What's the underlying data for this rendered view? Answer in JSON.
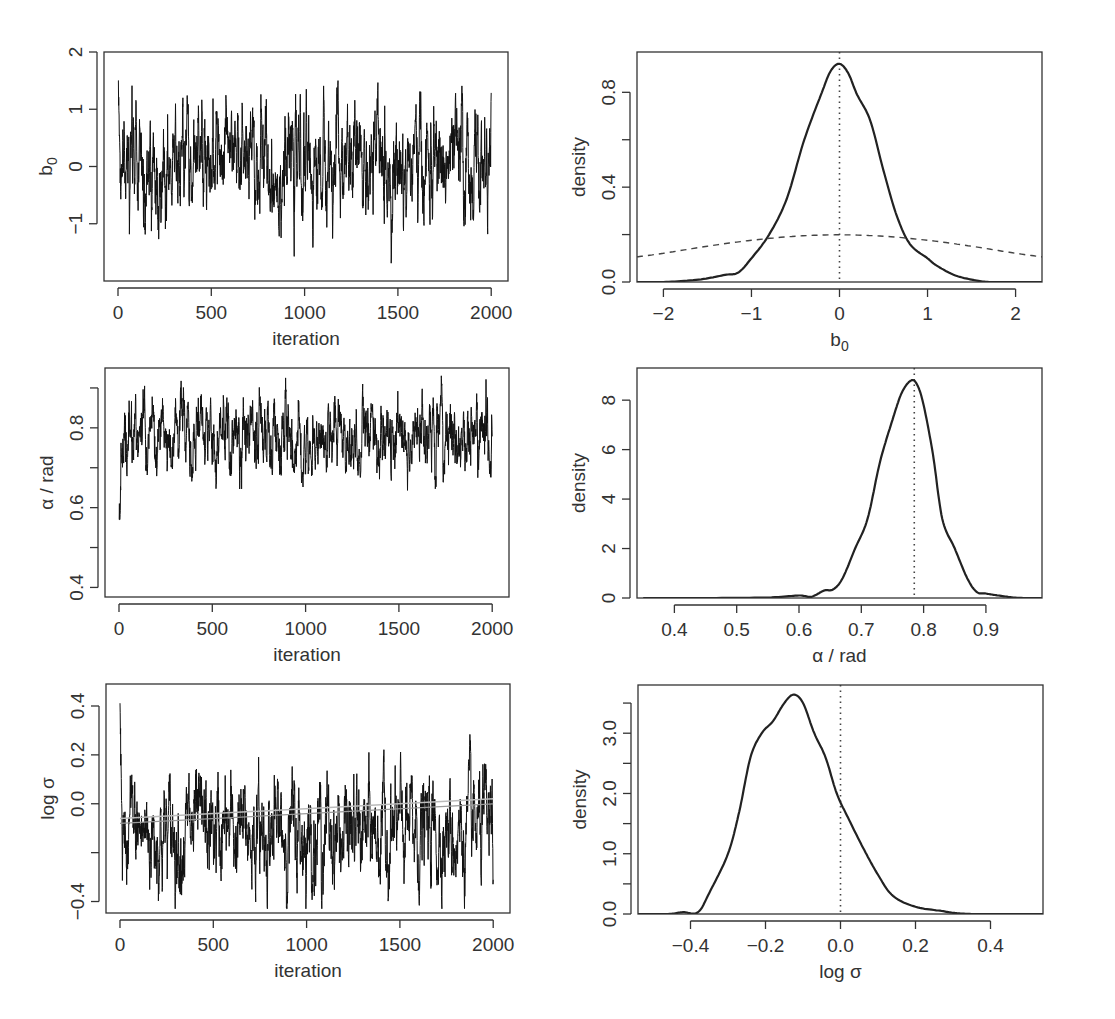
{
  "chart_data": [
    {
      "id": "trace_b0",
      "type": "line",
      "title": "",
      "xlabel": "iteration",
      "ylabel": "b0",
      "ylabel_display": "b",
      "ylabel_sub": "0",
      "xlim": [
        0,
        2000
      ],
      "ylim": [
        -2,
        2
      ],
      "xticks": [
        "0",
        "500",
        "1000",
        "1500",
        "2000"
      ],
      "yticks": [
        "−1",
        "0",
        "1",
        "2"
      ],
      "grid": false,
      "series": [
        {
          "name": "b0 MCMC trace",
          "x_range": [
            0,
            2000
          ],
          "start": 1.85,
          "mean": 0.0,
          "sd": 0.45,
          "min": -1.85,
          "max": 1.5
        }
      ]
    },
    {
      "id": "density_b0",
      "type": "line",
      "title": "",
      "xlabel": "b0",
      "xlabel_display": "b",
      "xlabel_sub": "0",
      "ylabel": "density",
      "xlim": [
        -2.3,
        2.3
      ],
      "ylim": [
        0,
        0.97
      ],
      "xticks": [
        "−2",
        "−1",
        "0",
        "1",
        "2"
      ],
      "yticks": [
        "0.0",
        "0.4",
        "0.8"
      ],
      "grid": false,
      "reference_line_x": 0,
      "series": [
        {
          "name": "posterior density",
          "style": "solid",
          "x": [
            -2.3,
            -2.0,
            -1.6,
            -1.3,
            -1.15,
            -1.0,
            -0.8,
            -0.6,
            -0.4,
            -0.2,
            -0.1,
            0.0,
            0.1,
            0.2,
            0.35,
            0.5,
            0.65,
            0.8,
            1.0,
            1.1,
            1.3,
            1.5,
            1.7,
            2.0,
            2.3
          ],
          "y": [
            0.0,
            0.0,
            0.01,
            0.03,
            0.04,
            0.1,
            0.2,
            0.35,
            0.6,
            0.8,
            0.89,
            0.92,
            0.88,
            0.79,
            0.68,
            0.47,
            0.28,
            0.16,
            0.1,
            0.07,
            0.03,
            0.01,
            0.0,
            0.0,
            0.0
          ]
        },
        {
          "name": "prior density",
          "style": "dashed",
          "x": [
            -2.3,
            -2.0,
            -1.5,
            -1.0,
            -0.5,
            0.0,
            0.5,
            1.0,
            1.5,
            2.0,
            2.3
          ],
          "y": [
            0.106,
            0.121,
            0.151,
            0.176,
            0.193,
            0.199,
            0.193,
            0.176,
            0.151,
            0.121,
            0.106
          ]
        }
      ]
    },
    {
      "id": "trace_alpha",
      "type": "line",
      "title": "",
      "xlabel": "iteration",
      "ylabel": "α / rad",
      "xlim": [
        0,
        2000
      ],
      "ylim": [
        0.38,
        0.95
      ],
      "xticks": [
        "0",
        "500",
        "1000",
        "1500",
        "2000"
      ],
      "yticks": [
        "0.4",
        "0.6",
        "0.8"
      ],
      "grid": false,
      "series": [
        {
          "name": "alpha MCMC trace",
          "x_range": [
            0,
            2000
          ],
          "start": 0.39,
          "mean": 0.775,
          "sd": 0.045,
          "min": 0.57,
          "max": 0.94
        }
      ]
    },
    {
      "id": "density_alpha",
      "type": "line",
      "title": "",
      "xlabel": "α / rad",
      "ylabel": "density",
      "xlim": [
        0.34,
        0.99
      ],
      "ylim": [
        0,
        9
      ],
      "xticks": [
        "0.4",
        "0.5",
        "0.6",
        "0.7",
        "0.8",
        "0.9"
      ],
      "yticks": [
        "0",
        "2",
        "4",
        "6",
        "8"
      ],
      "grid": false,
      "reference_line_x": 0.785,
      "series": [
        {
          "name": "posterior density",
          "style": "solid",
          "x": [
            0.35,
            0.45,
            0.55,
            0.6,
            0.62,
            0.64,
            0.655,
            0.67,
            0.69,
            0.71,
            0.73,
            0.75,
            0.765,
            0.78,
            0.79,
            0.8,
            0.815,
            0.83,
            0.85,
            0.87,
            0.885,
            0.9,
            0.92,
            0.95,
            0.99
          ],
          "y": [
            0.0,
            0.0,
            0.02,
            0.1,
            0.05,
            0.3,
            0.35,
            0.8,
            2.0,
            3.2,
            5.5,
            7.2,
            8.3,
            8.8,
            8.6,
            7.8,
            5.8,
            3.2,
            2.0,
            0.8,
            0.25,
            0.18,
            0.1,
            0.01,
            0.0
          ]
        }
      ]
    },
    {
      "id": "trace_logsigma",
      "type": "line",
      "title": "",
      "xlabel": "iteration",
      "ylabel": "log σ",
      "xlim": [
        0,
        2000
      ],
      "ylim": [
        -0.46,
        0.48
      ],
      "xticks": [
        "0",
        "500",
        "1000",
        "1500",
        "2000"
      ],
      "yticks": [
        "−0.4",
        "0.0",
        "0.2",
        "0.4"
      ],
      "grid": false,
      "series": [
        {
          "name": "log sigma MCMC trace",
          "x_range": [
            0,
            2000
          ],
          "start": 0.41,
          "mean": -0.12,
          "sd": 0.1,
          "min": -0.43,
          "max": 0.45
        },
        {
          "name": "running summary (grey)",
          "x": [
            0,
            2000
          ],
          "y": [
            -0.06,
            0.02
          ]
        }
      ]
    },
    {
      "id": "density_logsigma",
      "type": "line",
      "title": "",
      "xlabel": "log σ",
      "ylabel": "density",
      "xlim": [
        -0.54,
        0.54
      ],
      "ylim": [
        0,
        3.8
      ],
      "xticks": [
        "−0.4",
        "−0.2",
        "0.0",
        "0.2",
        "0.4"
      ],
      "yticks": [
        "0.0",
        "1.0",
        "2.0",
        "3.0"
      ],
      "grid": false,
      "reference_line_x": 0.0,
      "series": [
        {
          "name": "posterior density",
          "style": "solid",
          "x": [
            -0.54,
            -0.46,
            -0.42,
            -0.38,
            -0.35,
            -0.3,
            -0.27,
            -0.24,
            -0.21,
            -0.18,
            -0.15,
            -0.125,
            -0.1,
            -0.07,
            -0.04,
            -0.01,
            0.02,
            0.06,
            0.1,
            0.14,
            0.2,
            0.27,
            0.3,
            0.35,
            0.45,
            0.54
          ],
          "y": [
            0.0,
            0.0,
            0.03,
            0.03,
            0.35,
            1.0,
            1.7,
            2.6,
            3.0,
            3.2,
            3.5,
            3.64,
            3.5,
            3.0,
            2.6,
            2.0,
            1.6,
            1.1,
            0.65,
            0.3,
            0.12,
            0.05,
            0.02,
            0.0,
            0.0,
            0.0
          ]
        }
      ]
    }
  ]
}
